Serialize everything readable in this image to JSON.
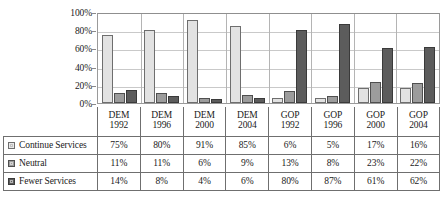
{
  "chart_data": {
    "type": "bar",
    "title": "",
    "subtitle": "",
    "xlabel": "",
    "ylabel": "",
    "ylim": [
      0,
      100
    ],
    "yticks": [
      "0%",
      "20%",
      "40%",
      "60%",
      "80%",
      "100%"
    ],
    "grid": true,
    "legend_position": "table-left",
    "categories": [
      "DEM 1992",
      "DEM 1996",
      "DEM 2000",
      "DEM 2004",
      "GOP 1992",
      "GOP 1996",
      "GOP 2000",
      "GOP 2004"
    ],
    "category_lines": [
      {
        "party": "DEM",
        "year": "1992"
      },
      {
        "party": "DEM",
        "year": "1996"
      },
      {
        "party": "DEM",
        "year": "2000"
      },
      {
        "party": "DEM",
        "year": "2004"
      },
      {
        "party": "GOP",
        "year": "1992"
      },
      {
        "party": "GOP",
        "year": "1996"
      },
      {
        "party": "GOP",
        "year": "2000"
      },
      {
        "party": "GOP",
        "year": "2004"
      }
    ],
    "series": [
      {
        "name": "Continue Services",
        "color": "#e2e2e2",
        "values": [
          75,
          80,
          91,
          85,
          6,
          5,
          17,
          16
        ],
        "labels": [
          "75%",
          "80%",
          "91%",
          "85%",
          "6%",
          "5%",
          "17%",
          "16%"
        ]
      },
      {
        "name": "Neutral",
        "color": "#9c9c9c",
        "values": [
          11,
          11,
          6,
          9,
          13,
          8,
          23,
          22
        ],
        "labels": [
          "11%",
          "11%",
          "6%",
          "9%",
          "13%",
          "8%",
          "23%",
          "22%"
        ]
      },
      {
        "name": "Fewer Services",
        "color": "#5c5c5c",
        "values": [
          14,
          8,
          4,
          6,
          80,
          87,
          61,
          62
        ],
        "labels": [
          "14%",
          "8%",
          "4%",
          "6%",
          "80%",
          "87%",
          "61%",
          "62%"
        ]
      }
    ]
  },
  "table": {
    "corner_label": ""
  }
}
